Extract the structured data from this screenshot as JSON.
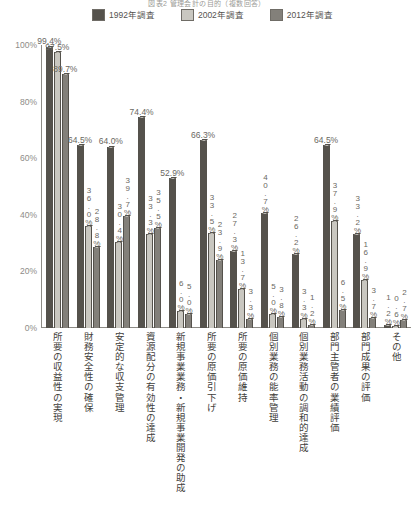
{
  "chart_title": "図表2 管理会計の目的（複数回答）",
  "legend": {
    "position": "top",
    "items": [
      {
        "label": "1992年調査",
        "color": "#55524c",
        "key": "1992"
      },
      {
        "label": "2002年調査",
        "color": "#c9c7c0",
        "key": "2002"
      },
      {
        "label": "2012年調査",
        "color": "#83807a",
        "key": "2012"
      }
    ]
  },
  "yaxis": {
    "label": "",
    "ticks": [
      "100%",
      "80%",
      "60%",
      "40%",
      "20%",
      "0%"
    ],
    "min": 0,
    "max": 100
  },
  "chart_data": {
    "type": "bar",
    "title": "図表2 管理会計の目的（複数回答）",
    "xlabel": "",
    "ylabel": "",
    "ylim": [
      0,
      100
    ],
    "grid": false,
    "legend_position": "top",
    "categories": [
      "所要の収益性の実現",
      "財務安全性の確保",
      "安定的な収支管理",
      "資源配分の有効性の達成",
      "新規事業業務・新規事業開発の助成",
      "所要の原価引下げ",
      "所要の原価維持",
      "個別業務の能率管理",
      "個別業務活動の調和的達成",
      "部門主管者の業績評価",
      "部門成果の評価",
      "その他"
    ],
    "series": [
      {
        "name": "1992年調査",
        "color": "#55524c",
        "values": [
          99.4,
          64.5,
          64.0,
          74.4,
          52.9,
          66.3,
          27.3,
          40.7,
          26.2,
          64.5,
          33.2,
          1.2
        ],
        "labels": [
          "99.4%",
          "64.5%",
          "64.0%",
          "74.4%",
          "52.9%",
          "66.3%",
          "27.3%",
          "40.7%",
          "26.2%",
          "64.5%",
          "33.2%",
          "1.2%"
        ]
      },
      {
        "name": "2002年調査",
        "color": "#c9c7c0",
        "values": [
          97.5,
          36.0,
          30.4,
          33.3,
          6.0,
          33.5,
          13.7,
          5.0,
          3.3,
          37.9,
          16.9,
          0.6
        ],
        "labels": [
          "97.5%",
          "36.0%",
          "30.4%",
          "33.3%",
          "6.0%",
          "33.5%",
          "13.7%",
          "5.0%",
          "3.3%",
          "37.9%",
          "16.9%",
          "0.6%"
        ]
      },
      {
        "name": "2012年調査",
        "color": "#83807a",
        "values": [
          89.7,
          28.8,
          39.7,
          35.5,
          5.0,
          23.9,
          3.3,
          3.8,
          1.2,
          6.5,
          3.7,
          2.7
        ],
        "labels": [
          "89.7%",
          "28.8%",
          "39.7%",
          "35.5%",
          "5.0%",
          "23.9%",
          "3.3%",
          "3.8%",
          "1.2%",
          "6.5%",
          "3.7%",
          "2.7%"
        ]
      }
    ]
  }
}
